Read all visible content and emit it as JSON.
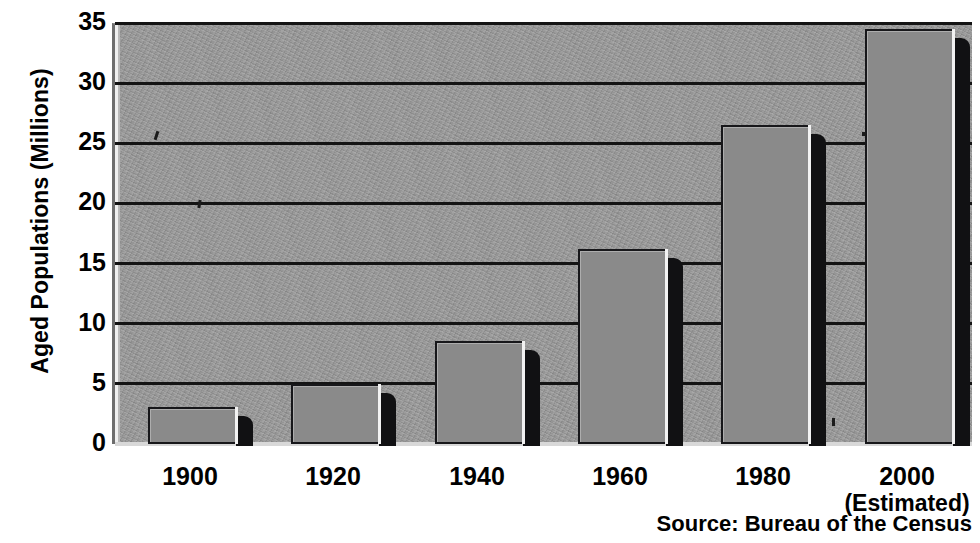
{
  "chart_data": {
    "type": "bar",
    "title": "",
    "subtitle": "",
    "xlabel": "",
    "ylabel": "Aged Populations (Millions)",
    "categories": [
      "1900",
      "1920",
      "1940",
      "1960",
      "1980",
      "2000"
    ],
    "category_sublabels": [
      "",
      "",
      "",
      "",
      "",
      "(Estimated)"
    ],
    "values": [
      3.1,
      5.0,
      8.6,
      16.2,
      26.5,
      34.5
    ],
    "ylim": [
      0,
      35
    ],
    "yticks": [
      0,
      5,
      10,
      15,
      20,
      25,
      30,
      35
    ],
    "ytick_labels": [
      "0",
      "5",
      "10",
      "15",
      "20",
      "25",
      "30",
      "35"
    ],
    "grid": true,
    "grid_axis": "y",
    "legend": false,
    "legend_position": "none",
    "annotations": [
      "Source: Bureau of the Census"
    ],
    "style": {
      "bar_face_color": "#8a8a8a",
      "bar_edge_color": "#17171a",
      "bar_side_color": "#111113",
      "plot_background": "#9a9a9a",
      "gridline_color": "#141414",
      "text_color": "#000000",
      "page_background": "#ffffff",
      "three_d": true
    }
  },
  "source_note": "Source: Bureau of the Census"
}
